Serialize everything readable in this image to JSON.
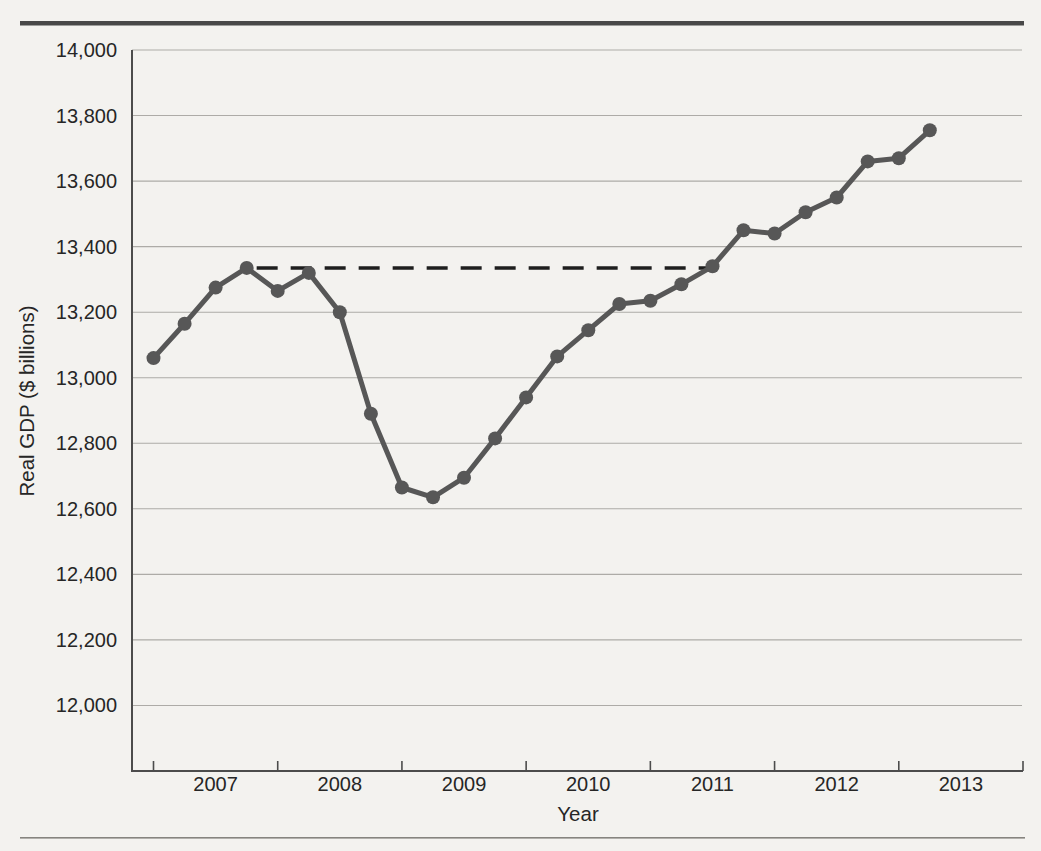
{
  "figure": {
    "background_color": "#f3f2ef",
    "top_rule_color": "#484848",
    "bottom_rule_color": "#86847f"
  },
  "chart_data": {
    "type": "line",
    "title": "",
    "xlabel": "Year",
    "ylabel": "Real GDP ($ billions)",
    "grid": "horizontal",
    "legend": "none",
    "axis_color": "#4c4c4c",
    "gridline_color": "#adaba7",
    "x_year_labels": [
      "2007",
      "2008",
      "2009",
      "2010",
      "2011",
      "2012",
      "2013"
    ],
    "y_tick_labels": [
      "14,000",
      "13,800",
      "13,600",
      "13,400",
      "13,200",
      "13,000",
      "12,800",
      "12,600",
      "12,400",
      "12,200",
      "12,000"
    ],
    "y_tick_values": [
      14000,
      13800,
      13600,
      13400,
      13200,
      13000,
      12800,
      12600,
      12400,
      12200,
      12000
    ],
    "ylim": [
      11800,
      14000
    ],
    "x": [
      "2007 Q1",
      "2007 Q2",
      "2007 Q3",
      "2007 Q4",
      "2008 Q1",
      "2008 Q2",
      "2008 Q3",
      "2008 Q4",
      "2009 Q1",
      "2009 Q2",
      "2009 Q3",
      "2009 Q4",
      "2010 Q1",
      "2010 Q2",
      "2010 Q3",
      "2010 Q4",
      "2011 Q1",
      "2011 Q2",
      "2011 Q3",
      "2011 Q4",
      "2012 Q1",
      "2012 Q2",
      "2012 Q3",
      "2012 Q4",
      "2013 Q1",
      "2013 Q2"
    ],
    "series": [
      {
        "name": "Real GDP",
        "color": "#575757",
        "marker": "circle",
        "values": [
          13060,
          13165,
          13275,
          13335,
          13265,
          13320,
          13200,
          12890,
          12665,
          12635,
          12695,
          12815,
          12940,
          13065,
          13145,
          13225,
          13235,
          13285,
          13340,
          13450,
          13440,
          13505,
          13550,
          13660,
          13670,
          13755
        ]
      }
    ],
    "annotations": [
      {
        "type": "dashed_horizontal_line",
        "value": 13335,
        "from_x": "2007 Q4",
        "to_x": "2011 Q3",
        "color": "#1e1e1e"
      }
    ]
  }
}
